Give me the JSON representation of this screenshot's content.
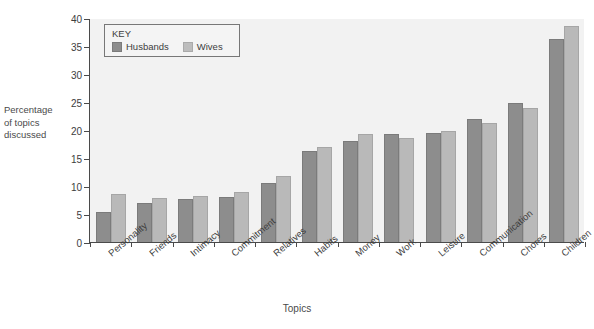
{
  "chart_data": {
    "type": "bar",
    "title": "",
    "xlabel": "Topics",
    "ylabel": "Percentage of topics discussed",
    "ylim": [
      0,
      40
    ],
    "yticks": [
      0,
      5,
      10,
      15,
      20,
      25,
      30,
      35,
      40
    ],
    "grid": false,
    "legend": {
      "title": "KEY",
      "position": "top-left",
      "entries": [
        "Husbands",
        "Wives"
      ]
    },
    "categories": [
      "Personality",
      "Friends",
      "Intimacy",
      "Commitment",
      "Relatives",
      "Habits",
      "Money",
      "Work",
      "Leisure",
      "Communication",
      "Chores",
      "Children"
    ],
    "series": [
      {
        "name": "Husbands",
        "color": "#8d8d8d",
        "values": [
          5.4,
          7.0,
          7.7,
          8.1,
          10.6,
          16.2,
          18.1,
          19.2,
          19.4,
          22.0,
          24.9,
          36.2
        ]
      },
      {
        "name": "Wives",
        "color": "#b9b9b9",
        "values": [
          8.5,
          7.9,
          8.3,
          9.0,
          11.7,
          17.0,
          19.2,
          18.6,
          19.9,
          21.3,
          23.9,
          38.6
        ]
      }
    ]
  },
  "ylabel_lines": [
    "Percentage",
    "of topics",
    "discussed"
  ]
}
